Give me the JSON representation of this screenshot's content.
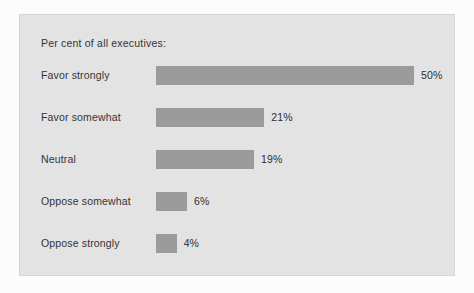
{
  "figure": {
    "background_color": "#fcfcfc",
    "panel_color": "#e3e3e3",
    "panel_border_color": "#d6d6d6"
  },
  "chart_data": {
    "type": "bar",
    "orientation": "horizontal",
    "title": "Per cent of all executives:",
    "xlabel": "",
    "ylabel": "",
    "grid": false,
    "legend": null,
    "xlim": [
      0,
      50
    ],
    "bar_color": "#9b9b9b",
    "value_suffix": "%",
    "categories": [
      "Favor strongly",
      "Favor somewhat",
      "Neutral",
      "Oppose somewhat",
      "Oppose strongly"
    ],
    "values": [
      50,
      21,
      19,
      6,
      4
    ],
    "value_labels": [
      "50%",
      "21%",
      "19%",
      "6%",
      "4%"
    ]
  }
}
